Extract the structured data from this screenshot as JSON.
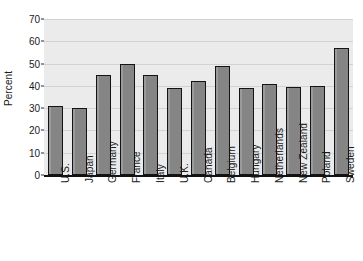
{
  "chart_data": {
    "type": "bar",
    "title": "",
    "xlabel": "",
    "ylabel": "Percent",
    "ylim": [
      0,
      70
    ],
    "yticks": [
      0,
      10,
      20,
      30,
      40,
      50,
      60,
      70
    ],
    "ytick_labels": [
      "0",
      "10",
      "20",
      "30",
      "40",
      "50",
      "60",
      "70"
    ],
    "grid": true,
    "legend": "none",
    "categories": [
      "U.S.",
      "Japan",
      "Germany",
      "France",
      "Italy",
      "U.K.",
      "Canada",
      "Belgium",
      "Hungary",
      "Netherlands",
      "New Zealand",
      "Poland",
      "Sweden"
    ],
    "values": [
      31,
      30,
      45,
      50,
      45,
      39,
      42,
      49,
      39,
      41,
      39.5,
      40,
      57
    ],
    "bar_color": "#858585",
    "bar_border_color": "#141414",
    "plot_background": "#ebebeb",
    "gridline_color": "#d2d2d2",
    "axis_color": "#111111",
    "text_color": "#1a1a1a"
  }
}
